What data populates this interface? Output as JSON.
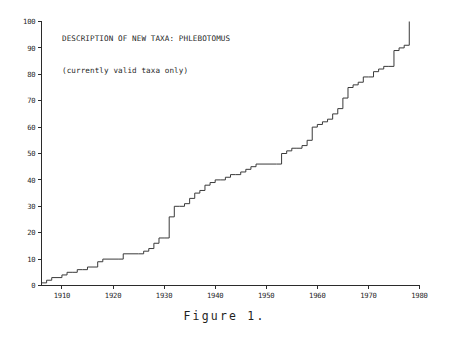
{
  "figure": {
    "caption": "Figure 1."
  },
  "chart_data": {
    "type": "line",
    "subtype": "cumulative-step",
    "title": "DESCRIPTION OF NEW TAXA: PHLEBOTOMUS",
    "subtitle": "(currently valid taxa only)",
    "xlabel": "",
    "ylabel": "",
    "xlim": [
      1906,
      1980
    ],
    "ylim": [
      0,
      100
    ],
    "xticks": [
      1910,
      1920,
      1930,
      1940,
      1950,
      1960,
      1970,
      1980
    ],
    "xticklabels": [
      "1910",
      "1920",
      "1930",
      "1940",
      "1950",
      "1960",
      "1970",
      "1980"
    ],
    "yticks": [
      0,
      10,
      20,
      30,
      40,
      50,
      60,
      70,
      80,
      90,
      100
    ],
    "yticklabels": [
      "0",
      "10",
      "20",
      "30",
      "40",
      "50",
      "60",
      "70",
      "80",
      "90",
      "100"
    ],
    "grid": false,
    "legend": false,
    "legend_position": "none",
    "series": [
      {
        "name": "Cumulative valid taxa",
        "x": [
          1906,
          1907,
          1908,
          1910,
          1911,
          1912,
          1913,
          1914,
          1915,
          1917,
          1918,
          1921,
          1922,
          1925,
          1926,
          1927,
          1928,
          1929,
          1930,
          1931,
          1932,
          1933,
          1934,
          1935,
          1936,
          1937,
          1938,
          1939,
          1940,
          1941,
          1942,
          1943,
          1944,
          1945,
          1946,
          1947,
          1948,
          1952,
          1953,
          1954,
          1955,
          1956,
          1957,
          1958,
          1959,
          1960,
          1961,
          1962,
          1963,
          1964,
          1965,
          1966,
          1967,
          1968,
          1969,
          1970,
          1971,
          1972,
          1973,
          1974,
          1975,
          1976,
          1977,
          1978
        ],
        "y": [
          1,
          2,
          3,
          4,
          5,
          5,
          6,
          6,
          7,
          9,
          10,
          10,
          12,
          12,
          13,
          14,
          16,
          18,
          18,
          26,
          30,
          30,
          31,
          33,
          35,
          36,
          38,
          39,
          40,
          40,
          41,
          42,
          42,
          43,
          44,
          45,
          46,
          46,
          50,
          51,
          52,
          52,
          53,
          55,
          60,
          61,
          62,
          63,
          65,
          67,
          71,
          75,
          76,
          77,
          79,
          79,
          81,
          82,
          83,
          83,
          89,
          90,
          91,
          91
        ],
        "final_jump_to": 100
      }
    ],
    "annotations": [
      "Steep vertical rise at 1930-1931 from 18 to 26 taxa",
      "Jump at 1952 from 46 to 50 taxa",
      "Final vertical jump at 1978 reaching 100"
    ]
  },
  "axes": {
    "y_axis_name": "y-axis",
    "x_axis_name": "x-axis"
  }
}
